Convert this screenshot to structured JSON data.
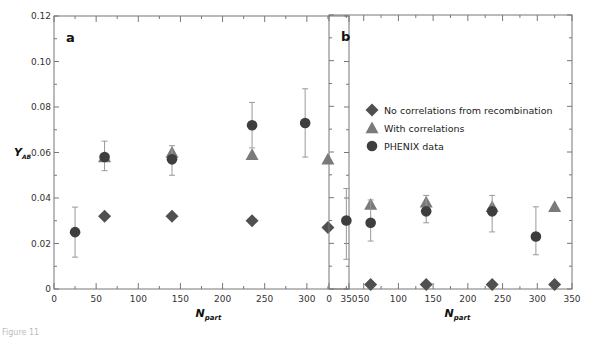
{
  "figure": {
    "caption": "Figure 11",
    "colors": {
      "diamond": "#505050",
      "triangle": "#7a7a7a",
      "circle": "#3e3e3e",
      "errorbar": "#999999",
      "axis": "#777777"
    }
  },
  "chart_data": [
    {
      "type": "scatter",
      "panel": "a",
      "title": "",
      "xlabel": "N_part",
      "ylabel": "Y_AB",
      "xlim": [
        0,
        350
      ],
      "ylim": [
        0,
        0.12
      ],
      "xticks": [
        0,
        50,
        100,
        150,
        200,
        250,
        300,
        350
      ],
      "yticks": [
        0,
        0.02,
        0.04,
        0.06,
        0.08,
        0.1,
        0.12
      ],
      "ytick_labels": [
        "0",
        "0.02",
        "0.04",
        "0.06",
        "0.08",
        "0.10",
        "0.12"
      ],
      "grid": false,
      "series": [
        {
          "name": "No correlations from recombination",
          "marker": "diamond",
          "x": [
            60,
            140,
            235,
            325
          ],
          "y": [
            0.032,
            0.032,
            0.03,
            0.027
          ]
        },
        {
          "name": "With correlations",
          "marker": "triangle",
          "x": [
            60,
            140,
            235,
            325
          ],
          "y": [
            0.058,
            0.06,
            0.059,
            0.057
          ]
        },
        {
          "name": "PHENIX data",
          "marker": "circle",
          "x": [
            25,
            60,
            140,
            235,
            298
          ],
          "y": [
            0.025,
            0.058,
            0.057,
            0.072,
            0.073
          ],
          "err_low": [
            0.014,
            0.052,
            0.05,
            0.062,
            0.058
          ],
          "err_high": [
            0.036,
            0.065,
            0.063,
            0.082,
            0.088
          ]
        }
      ]
    },
    {
      "type": "scatter",
      "panel": "b",
      "title": "",
      "xlabel": "N_part",
      "ylabel": "",
      "xlim": [
        0,
        350
      ],
      "ylim": [
        0,
        0.12
      ],
      "xticks": [
        0,
        50,
        100,
        150,
        200,
        250,
        300,
        350
      ],
      "yticks": [
        0,
        0.02,
        0.04,
        0.06,
        0.08,
        0.1,
        0.12
      ],
      "ytick_labels": [],
      "grid": false,
      "legend": {
        "position": "upper-left-center",
        "entries": [
          "No correlations from recombination",
          "With correlations",
          "PHENIX data"
        ]
      },
      "series": [
        {
          "name": "No correlations from recombination",
          "marker": "diamond",
          "x": [
            60,
            140,
            235,
            325
          ],
          "y": [
            0.002,
            0.002,
            0.002,
            0.002
          ]
        },
        {
          "name": "With correlations",
          "marker": "triangle",
          "x": [
            60,
            140,
            235,
            325
          ],
          "y": [
            0.037,
            0.038,
            0.036,
            0.036
          ]
        },
        {
          "name": "PHENIX data",
          "marker": "circle",
          "x": [
            25,
            60,
            140,
            235,
            298
          ],
          "y": [
            0.03,
            0.029,
            0.034,
            0.034,
            0.023
          ],
          "err_low": [
            0.013,
            0.021,
            0.029,
            0.025,
            0.015
          ],
          "err_high": [
            0.044,
            0.039,
            0.041,
            0.041,
            0.036
          ]
        }
      ]
    }
  ],
  "panels": {
    "a": {
      "letter": "a"
    },
    "b": {
      "letter": "b"
    }
  },
  "axes": {
    "x_title_main": "N",
    "x_title_sub": "part",
    "y_title_main": "Y",
    "y_title_sub": "AB"
  },
  "legend": {
    "items": [
      {
        "label": "No correlations from recombination",
        "marker": "diamond"
      },
      {
        "label": "With correlations",
        "marker": "triangle"
      },
      {
        "label": "PHENIX data",
        "marker": "circle"
      }
    ]
  }
}
